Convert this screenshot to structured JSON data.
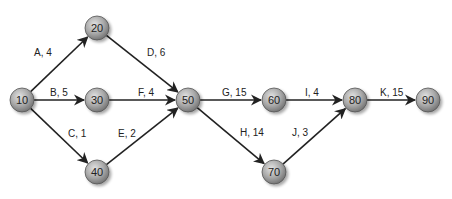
{
  "diagram": {
    "type": "activity-on-arrow network",
    "nodes": [
      {
        "id": "10",
        "label": "10",
        "x": 22,
        "y": 100
      },
      {
        "id": "20",
        "label": "20",
        "x": 97,
        "y": 28
      },
      {
        "id": "30",
        "label": "30",
        "x": 97,
        "y": 100
      },
      {
        "id": "40",
        "label": "40",
        "x": 97,
        "y": 172
      },
      {
        "id": "50",
        "label": "50",
        "x": 188,
        "y": 100
      },
      {
        "id": "60",
        "label": "60",
        "x": 274,
        "y": 100
      },
      {
        "id": "70",
        "label": "70",
        "x": 274,
        "y": 172
      },
      {
        "id": "80",
        "label": "80",
        "x": 355,
        "y": 100
      },
      {
        "id": "90",
        "label": "90",
        "x": 428,
        "y": 100
      }
    ],
    "edges": [
      {
        "from": "10",
        "to": "20",
        "label": "A, 4",
        "lx": 34,
        "ly": 56
      },
      {
        "from": "10",
        "to": "30",
        "label": "B, 5",
        "lx": 50,
        "ly": 96
      },
      {
        "from": "10",
        "to": "40",
        "label": "C, 1",
        "lx": 68,
        "ly": 137
      },
      {
        "from": "20",
        "to": "50",
        "label": "D, 6",
        "lx": 147,
        "ly": 56
      },
      {
        "from": "30",
        "to": "50",
        "label": "F, 4",
        "lx": 138,
        "ly": 96
      },
      {
        "from": "40",
        "to": "50",
        "label": "E, 2",
        "lx": 118,
        "ly": 137
      },
      {
        "from": "50",
        "to": "60",
        "label": "G, 15",
        "lx": 222,
        "ly": 96
      },
      {
        "from": "50",
        "to": "70",
        "label": "H, 14",
        "lx": 240,
        "ly": 136
      },
      {
        "from": "60",
        "to": "80",
        "label": "I, 4",
        "lx": 305,
        "ly": 96
      },
      {
        "from": "70",
        "to": "80",
        "label": "J, 3",
        "lx": 292,
        "ly": 136
      },
      {
        "from": "80",
        "to": "90",
        "label": "K, 15",
        "lx": 380,
        "ly": 96
      }
    ],
    "node_radius": 12,
    "colors": {
      "node_fill_light": "#d4d4d4",
      "node_fill_dark": "#7a7a7a",
      "node_stroke": "#555555",
      "edge": "#222222",
      "text": "#222222"
    }
  }
}
